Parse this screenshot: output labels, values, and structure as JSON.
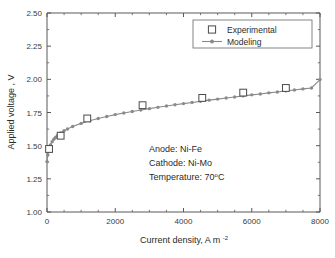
{
  "chart_data": {
    "type": "line",
    "title": "",
    "xlabel": "Current density, A m",
    "xlabel_sup": "-2",
    "ylabel": "Applied voltage , V",
    "xlim": [
      0,
      8000
    ],
    "ylim": [
      1.0,
      2.5
    ],
    "xticks": [
      0,
      2000,
      4000,
      6000,
      8000
    ],
    "xticklabels": [
      "0",
      "2000",
      "4000",
      "6000",
      "8000"
    ],
    "yticks": [
      1.0,
      1.25,
      1.5,
      1.75,
      2.0,
      2.25,
      2.5
    ],
    "yticklabels": [
      "1.00",
      "1.25",
      "1.50",
      "1.75",
      "2.00",
      "2.25",
      "2.50"
    ],
    "x_minor_interval": 500,
    "y_minor_interval": 0.125,
    "grid": false,
    "legend_position": "top-right",
    "series": [
      {
        "name": "Experimental",
        "marker": "open-square",
        "style": "markers-only",
        "color": "#4a4a4a",
        "points": [
          {
            "x": 60,
            "y": 1.475
          },
          {
            "x": 400,
            "y": 1.575
          },
          {
            "x": 1180,
            "y": 1.705
          },
          {
            "x": 2800,
            "y": 1.805
          },
          {
            "x": 4550,
            "y": 1.86
          },
          {
            "x": 5750,
            "y": 1.9
          },
          {
            "x": 7000,
            "y": 1.935
          }
        ]
      },
      {
        "name": "Modeling",
        "marker": "filled-circle",
        "style": "line-markers",
        "color": "#8a8a8a",
        "points": [
          {
            "x": 0,
            "y": 1.38
          },
          {
            "x": 25,
            "y": 1.43
          },
          {
            "x": 50,
            "y": 1.465
          },
          {
            "x": 75,
            "y": 1.487
          },
          {
            "x": 100,
            "y": 1.505
          },
          {
            "x": 150,
            "y": 1.53
          },
          {
            "x": 200,
            "y": 1.548
          },
          {
            "x": 250,
            "y": 1.562
          },
          {
            "x": 300,
            "y": 1.575
          },
          {
            "x": 400,
            "y": 1.596
          },
          {
            "x": 500,
            "y": 1.612
          },
          {
            "x": 600,
            "y": 1.626
          },
          {
            "x": 750,
            "y": 1.644
          },
          {
            "x": 1000,
            "y": 1.668
          },
          {
            "x": 1250,
            "y": 1.688
          },
          {
            "x": 1500,
            "y": 1.705
          },
          {
            "x": 1750,
            "y": 1.72
          },
          {
            "x": 2000,
            "y": 1.734
          },
          {
            "x": 2250,
            "y": 1.746
          },
          {
            "x": 2500,
            "y": 1.758
          },
          {
            "x": 2750,
            "y": 1.769
          },
          {
            "x": 3000,
            "y": 1.779
          },
          {
            "x": 3250,
            "y": 1.789
          },
          {
            "x": 3500,
            "y": 1.799
          },
          {
            "x": 3750,
            "y": 1.808
          },
          {
            "x": 4000,
            "y": 1.817
          },
          {
            "x": 4250,
            "y": 1.826
          },
          {
            "x": 4500,
            "y": 1.834
          },
          {
            "x": 4750,
            "y": 1.843
          },
          {
            "x": 5000,
            "y": 1.851
          },
          {
            "x": 5250,
            "y": 1.859
          },
          {
            "x": 5500,
            "y": 1.867
          },
          {
            "x": 5750,
            "y": 1.875
          },
          {
            "x": 6000,
            "y": 1.883
          },
          {
            "x": 6250,
            "y": 1.89
          },
          {
            "x": 6500,
            "y": 1.898
          },
          {
            "x": 6750,
            "y": 1.905
          },
          {
            "x": 7000,
            "y": 1.913
          },
          {
            "x": 7250,
            "y": 1.92
          },
          {
            "x": 7500,
            "y": 1.928
          },
          {
            "x": 7750,
            "y": 1.935
          },
          {
            "x": 8000,
            "y": 1.998
          }
        ]
      }
    ],
    "annotations": [
      "Anode: Ni-Fe",
      "Cathode: Ni-Mo",
      "Temperature: 70"
    ],
    "annotation_temp_unit": "C",
    "annotation_temp_degree": "o"
  },
  "legend": {
    "entries": [
      {
        "label": "Experimental",
        "marker": "open-square"
      },
      {
        "label": "Modeling",
        "marker": "line-circle"
      }
    ]
  }
}
